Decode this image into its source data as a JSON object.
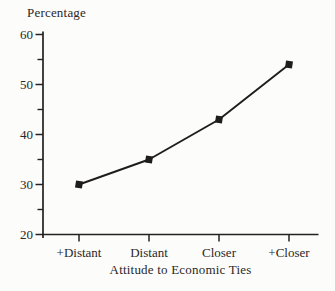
{
  "chart_data": {
    "type": "line",
    "categories": [
      "+Distant",
      "Distant",
      "Closer",
      "+Closer"
    ],
    "values": [
      30,
      35,
      43,
      54
    ],
    "series_name": "Attitude to economic ties (percentage)",
    "title": "",
    "ylabel": "Percentage",
    "xlabel": "Attitude to Economic Ties",
    "ylim": [
      20,
      60
    ],
    "yticks": [
      20,
      30,
      40,
      50,
      60
    ],
    "yticks_minor": [
      25,
      35,
      45,
      55
    ],
    "grid": false,
    "legend_position": "none",
    "marker": "filled-square",
    "line_color": "#1e1d1b",
    "axis_color": "#232220",
    "background_color": "#fcfcfb"
  }
}
